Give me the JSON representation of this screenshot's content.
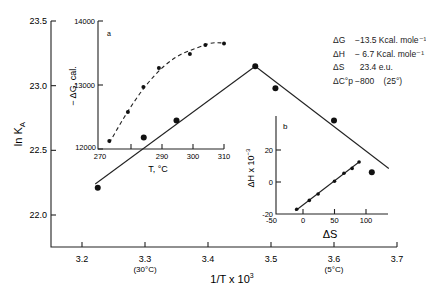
{
  "chart_data": [
    {
      "id": "main",
      "type": "scatter",
      "title": "",
      "xlabel": "1/T x 10^3",
      "ylabel": "ln K_A",
      "xlim": [
        3.15,
        3.7
      ],
      "ylim": [
        21.76,
        23.5
      ],
      "x_ticks": [
        3.2,
        3.3,
        3.4,
        3.5,
        3.6,
        3.7
      ],
      "x_tick_labels": [
        "3.2",
        "3.3",
        "3.4",
        "3.5",
        "3.6",
        "3.7"
      ],
      "x_tick_sublabels": {
        "3.3": "(30°C)",
        "3.6": "(5°C)"
      },
      "y_ticks": [
        22.0,
        22.5,
        23.0,
        23.5
      ],
      "y_tick_labels": [
        "22.0",
        "22.5",
        "23.0",
        "23.5"
      ],
      "grid": false,
      "series": [
        {
          "name": "ln KA data",
          "x": [
            3.225,
            3.298,
            3.35,
            3.475,
            3.507,
            3.6,
            3.66
          ],
          "y": [
            22.21,
            22.6,
            22.73,
            23.15,
            22.98,
            22.73,
            22.33
          ]
        }
      ],
      "fit_lines": [
        {
          "x": [
            3.221,
            3.475
          ],
          "y": [
            22.24,
            23.15
          ]
        },
        {
          "x": [
            3.475,
            3.687
          ],
          "y": [
            23.15,
            22.36
          ]
        }
      ],
      "annotations": [
        {
          "label": "ΔG",
          "value": "−13.5 Kcal. mole⁻¹"
        },
        {
          "label": "ΔH",
          "value": "− 6.7 Kcal. mole⁻¹"
        },
        {
          "label": "ΔS",
          "value": "23.4 e.u."
        },
        {
          "label": "ΔC°p",
          "value": "−800   (25°)"
        }
      ]
    },
    {
      "id": "inset_a",
      "panel_label": "a",
      "type": "scatter",
      "xlabel": "T, °C",
      "ylabel": "− ΔG, cal.",
      "xlim": [
        270,
        310
      ],
      "ylim": [
        12000,
        14000
      ],
      "x_ticks": [
        270,
        280,
        290,
        300,
        310
      ],
      "x_tick_labels": [
        "270",
        "",
        "290",
        "300",
        "310"
      ],
      "y_ticks": [
        12000,
        13000,
        14000
      ],
      "y_tick_labels": [
        "12000",
        "13000",
        "14000"
      ],
      "series": [
        {
          "name": "−ΔG",
          "x": [
            273,
            279,
            284,
            289,
            299,
            304,
            310
          ],
          "y": [
            12125,
            12580,
            12970,
            13265,
            13485,
            13625,
            13650
          ]
        }
      ],
      "fit": "dashed curve"
    },
    {
      "id": "inset_b",
      "panel_label": "b",
      "type": "scatter",
      "xlabel": "ΔS",
      "ylabel": "ΔH x 10⁻³",
      "xlim": [
        -50,
        125
      ],
      "ylim": [
        -20,
        35
      ],
      "x_ticks": [
        -50,
        0,
        50,
        100
      ],
      "x_tick_labels": [
        "-50",
        "0",
        "50",
        "100"
      ],
      "y_ticks": [
        -20,
        0,
        20
      ],
      "y_tick_labels": [
        "-20",
        "0",
        "20"
      ],
      "series": [
        {
          "name": "ΔH vs ΔS",
          "x": [
            -10,
            10,
            24,
            50,
            65,
            78,
            89
          ],
          "y": [
            -17,
            -11.5,
            -7.5,
            0.5,
            5.5,
            8.5,
            12.5
          ]
        }
      ],
      "fit_lines": [
        {
          "x": [
            -12,
            89
          ],
          "y": [
            -18,
            12.5
          ]
        }
      ]
    }
  ],
  "labels": {
    "main_ylabel": "ln K",
    "main_ylabel_sub": "A",
    "main_xlabel": "1/T  x 10",
    "main_xlabel_sup": "3",
    "inset_a_ylabel": "− ΔG, cal.",
    "inset_a_xlabel": "T, °C",
    "inset_a_panel": "a",
    "inset_b_ylabel": "ΔH x 10",
    "inset_b_ylabel_sup": "−3",
    "inset_b_xlabel": "ΔS",
    "inset_b_panel": "b"
  },
  "legend": [
    {
      "k": "ΔG",
      "v": "−13.5 Kcal. mole⁻¹"
    },
    {
      "k": "ΔH",
      "v": "− 6.7 Kcal. mole⁻¹"
    },
    {
      "k": "ΔS",
      "v": "  23.4 e.u."
    },
    {
      "k": "ΔC°p",
      "v": "−800    (25°)"
    }
  ]
}
